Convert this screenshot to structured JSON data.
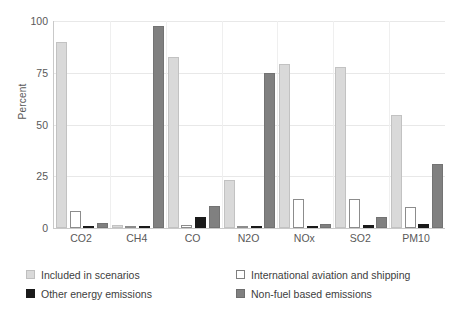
{
  "chart_data": {
    "type": "bar",
    "title": "",
    "xlabel": "",
    "ylabel": "Percent",
    "ylim": [
      0,
      100
    ],
    "yticks": [
      0,
      25,
      50,
      75,
      100
    ],
    "ytick_labels": [
      "0",
      "25",
      "50",
      "75",
      "100"
    ],
    "grid": true,
    "legend_position": "bottom",
    "categories": [
      "CO2",
      "CH4",
      "CO",
      "N2O",
      "NOx",
      "SO2",
      "PM10"
    ],
    "series": [
      {
        "name": "Included in scenarios",
        "color": "#d9d9d9",
        "values": [
          90,
          1.5,
          82.5,
          23,
          79,
          78,
          54.5
        ]
      },
      {
        "name": "International aviation and shipping",
        "color": "#ffffff",
        "values": [
          8,
          0.5,
          1.5,
          1,
          14,
          14,
          10
        ]
      },
      {
        "name": "Other energy emissions",
        "color": "#1a1a1a",
        "values": [
          1,
          0.5,
          5.5,
          0.5,
          1,
          1.5,
          2
        ]
      },
      {
        "name": "Non-fuel based emissions",
        "color": "#808080",
        "values": [
          2.5,
          97.5,
          10.5,
          75,
          2,
          5.5,
          31
        ]
      }
    ]
  }
}
